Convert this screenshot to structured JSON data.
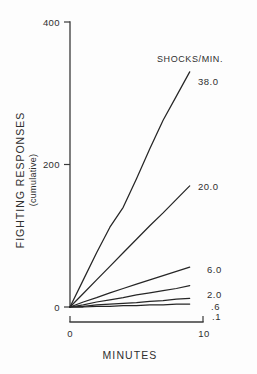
{
  "chart_data": {
    "type": "line",
    "title": "",
    "xlabel": "MINUTES",
    "ylabel": "FIGHTING RESPONSES",
    "ylabel_sub": "(cumulative)",
    "legend_title": "SHOCKS/MIN.",
    "legend_position": "right-inline",
    "grid": false,
    "xlim": [
      0,
      10
    ],
    "ylim": [
      0,
      400
    ],
    "xticks": [
      "0",
      "10"
    ],
    "xtick_values": [
      0,
      10
    ],
    "yticks": [
      "0",
      "200",
      "400"
    ],
    "ytick_values": [
      0,
      200,
      400
    ],
    "x": [
      0,
      1,
      2,
      3,
      4,
      5,
      6,
      7,
      8,
      9
    ],
    "series": [
      {
        "name": "38.0",
        "label": "38.0",
        "values": [
          0,
          38,
          76,
          112,
          140,
          180,
          222,
          262,
          296,
          330
        ]
      },
      {
        "name": "20.0",
        "label": "20.0",
        "values": [
          0,
          19,
          38,
          57,
          76,
          95,
          114,
          132,
          151,
          170
        ]
      },
      {
        "name": "6.0",
        "label": "6.0",
        "values": [
          0,
          7,
          13,
          20,
          26,
          32,
          38,
          44,
          50,
          56
        ]
      },
      {
        "name": "2.0",
        "label": "2.0",
        "values": [
          0,
          3,
          7,
          10,
          13,
          17,
          20,
          23,
          26,
          30
        ]
      },
      {
        "name": ".6",
        "label": ".6",
        "values": [
          0,
          1,
          3,
          4,
          5,
          6,
          8,
          9,
          11,
          12
        ]
      },
      {
        "name": ".1",
        "label": ".1",
        "values": [
          0,
          0,
          1,
          1,
          2,
          2,
          3,
          3,
          4,
          4
        ]
      }
    ]
  },
  "colors": {
    "curve": "#262626",
    "axis": "#3a3a3a",
    "text": "#2f2f2f",
    "background": "#fdfdfd"
  }
}
